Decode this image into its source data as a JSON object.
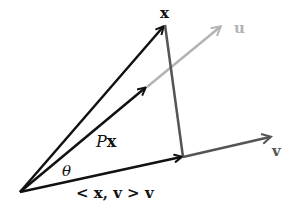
{
  "diagram": {
    "colors": {
      "black": "#111111",
      "dark_gray": "#555555",
      "light_gray": "#b3b3b3"
    },
    "points": {
      "origin": [
        20,
        192
      ],
      "x_tip": [
        165,
        25
      ],
      "u_tip": [
        222,
        26
      ],
      "px_tip": [
        147,
        87
      ],
      "projection": [
        183,
        157
      ],
      "v_tip": [
        272,
        137
      ]
    },
    "vectors": [
      {
        "name": "x",
        "from": "origin",
        "to": "x_tip",
        "color": "black"
      },
      {
        "name": "Px",
        "from": "origin",
        "to": "px_tip",
        "color": "black"
      },
      {
        "name": "u",
        "from": "px_tip",
        "to": "u_tip",
        "color": "light_gray"
      },
      {
        "name": "<x,v>v",
        "from": "origin",
        "to": "projection",
        "color": "black"
      },
      {
        "name": "v",
        "from": "projection",
        "to": "v_tip",
        "color": "dark_gray"
      },
      {
        "name": "x-minus-projection",
        "from": "x_tip",
        "to": "projection",
        "color": "dark_gray",
        "arrow": false
      }
    ],
    "labels": {
      "x": "x",
      "u": "u",
      "v": "v",
      "px_p": "P",
      "px_x": "x",
      "theta": "θ",
      "inner": "< x, v > v"
    }
  }
}
